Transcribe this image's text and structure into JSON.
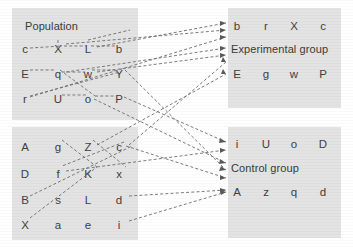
{
  "figure": {
    "type": "diagram",
    "background_color": "#ffffff",
    "panel_color": "#e3e3e3",
    "line_color": "#6d6d6d",
    "text_color": "#3f3f3f"
  },
  "panels": [
    {
      "id": "population",
      "title": "Population",
      "title_visible": true,
      "x": 12,
      "y": 8,
      "w": 126,
      "h": 112,
      "rows": [
        [
          "c",
          "X",
          "L",
          "b"
        ],
        [
          "E",
          "q",
          "w",
          "Y"
        ],
        [
          "r",
          "U",
          "o",
          "P"
        ]
      ]
    },
    {
      "id": "population2",
      "title": "",
      "title_visible": false,
      "x": 12,
      "y": 127,
      "w": 126,
      "h": 113,
      "rows": [
        [
          "A",
          "g",
          "Z",
          "c"
        ],
        [
          "D",
          "f",
          "K",
          "x"
        ],
        [
          "B",
          "s",
          "L",
          "d"
        ],
        [
          "X",
          "a",
          "e",
          "i"
        ]
      ]
    },
    {
      "id": "experimental",
      "title": "Experimental group",
      "title_visible": true,
      "x": 228,
      "y": 8,
      "w": 113,
      "h": 100,
      "rows_before_title": [
        [
          "b",
          "r",
          "X",
          "c"
        ]
      ],
      "rows_after_title": [
        [
          "E",
          "g",
          "w",
          "P"
        ]
      ]
    },
    {
      "id": "control",
      "title": "Control group",
      "title_visible": true,
      "x": 228,
      "y": 127,
      "w": 113,
      "h": 111,
      "rows_before_title": [
        [
          "i",
          "U",
          "o",
          "D"
        ]
      ],
      "rows_after_title": [
        [
          "A",
          "z",
          "q",
          "d"
        ]
      ]
    }
  ],
  "arrows": {
    "style": "dashed-with-arrowhead",
    "to_experimental": [
      {
        "from": "L",
        "to": "b"
      },
      {
        "from": "X",
        "to": "r-row"
      },
      {
        "from": "q",
        "to": "Experimental group"
      },
      {
        "from": "w",
        "to": "Experimental group"
      },
      {
        "from": "c",
        "to": "E"
      },
      {
        "from": "Z",
        "to": "E"
      }
    ],
    "to_control": [
      {
        "from": "P",
        "to": "i"
      },
      {
        "from": "o",
        "to": "Control group"
      },
      {
        "from": "Y",
        "to": "Control group"
      },
      {
        "from": "c2",
        "to": "Control group"
      },
      {
        "from": "d",
        "to": "A"
      },
      {
        "from": "i2",
        "to": "A"
      }
    ]
  }
}
